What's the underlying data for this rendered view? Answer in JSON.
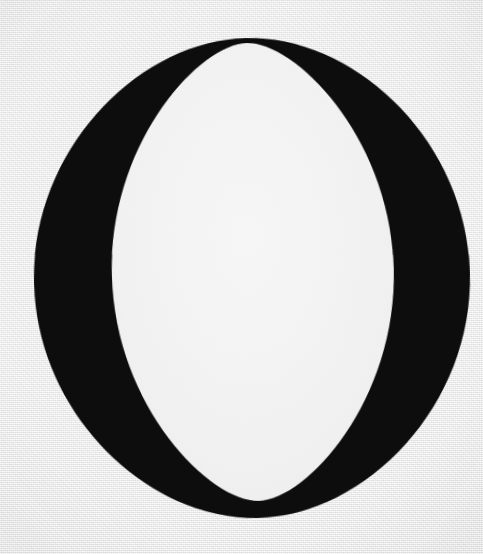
{
  "page": {
    "kind": "typographic-specimen-scan",
    "character": "O",
    "character_name": "Latin Capital Letter O",
    "typeface_style": "Didone / Modern serif, high stroke contrast, vertical stress",
    "background_color": "#ececec",
    "paper_tone": "#efefef",
    "ink_color": "#0a0a0a",
    "counter_color": "#f2f2f2",
    "width": 483,
    "height": 554
  },
  "glyph": {
    "label": "O",
    "ink_color": "#0a0a0a",
    "counter_fill": "#f1f1f1",
    "outer": {
      "center_x": 252,
      "center_y": 278,
      "radius_x": 218,
      "radius_y": 240,
      "top_y": 38,
      "bottom_y": 518,
      "left_x": 34,
      "right_x": 470
    },
    "counter": {
      "center_x": 253,
      "center_y": 272,
      "radius_x": 141,
      "radius_y": 229,
      "top_y": 43,
      "bottom_y": 501,
      "left_x": 112,
      "right_x": 394
    },
    "stroke_weights": {
      "thick_left_px": 78,
      "thick_right_px": 76,
      "hairline_top_px": 5,
      "hairline_bottom_px": 6
    },
    "axis_tilt_degrees": -1.5
  },
  "caption": {
    "visible": false,
    "text": ""
  }
}
